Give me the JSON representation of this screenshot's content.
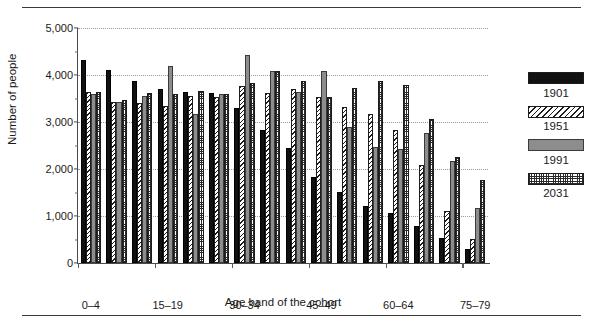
{
  "figure": {
    "clipped_title": "",
    "background": "#ffffff"
  },
  "axes": {
    "ylabel": "Number of people",
    "xlabel": "Age band of the cohort",
    "yticks": [
      "0",
      "1,000",
      "2,000",
      "3,000",
      "4,000",
      "5,000"
    ],
    "ymin": 0,
    "ymax": 5000
  },
  "legend": {
    "items": [
      {
        "label": "1901",
        "pattern": "solid-black",
        "color": "#111111"
      },
      {
        "label": "1951",
        "pattern": "diagonal-hatch",
        "color": "#ffffff"
      },
      {
        "label": "1991",
        "pattern": "solid-gray",
        "color": "#8d8d8d"
      },
      {
        "label": "2031",
        "pattern": "checker-dot",
        "color": "#ffffff"
      }
    ]
  },
  "chart_data": {
    "type": "bar",
    "title": "",
    "xlabel": "Age band of the cohort",
    "ylabel": "Number of people",
    "ylim": [
      0,
      5000
    ],
    "ytick_step": 1000,
    "grid": "horizontal-dotted",
    "legend_position": "right",
    "categories": [
      "0–4",
      "5–9",
      "10–14",
      "15–19",
      "20–24",
      "25–29",
      "30–34",
      "35–39",
      "40–44",
      "45–49",
      "50–54",
      "55–59",
      "60–64",
      "65–69",
      "70–74",
      "75–79"
    ],
    "visible_tick_labels": [
      "0–4",
      "15–19",
      "30–34",
      "45–49",
      "60–64",
      "75–79"
    ],
    "visible_tick_indices": [
      0,
      3,
      6,
      9,
      12,
      15
    ],
    "series": [
      {
        "name": "1901",
        "color": "#111111",
        "values": [
          4320,
          4100,
          3880,
          3700,
          3640,
          3620,
          3300,
          2840,
          2450,
          1820,
          1520,
          1220,
          1060,
          780,
          530,
          300
        ]
      },
      {
        "name": "1951",
        "color": "#ffffff",
        "values": [
          3640,
          3420,
          3400,
          3350,
          3560,
          3540,
          3770,
          3620,
          3700,
          3540,
          3320,
          3180,
          2830,
          2080,
          1100,
          520
        ]
      },
      {
        "name": "1991",
        "color": "#8d8d8d",
        "values": [
          3600,
          3430,
          3560,
          4190,
          3180,
          3600,
          4420,
          4080,
          3630,
          4080,
          2900,
          2470,
          2420,
          2760,
          2180,
          1180
        ]
      },
      {
        "name": "2031",
        "color": "#ffffff",
        "values": [
          3630,
          3460,
          3620,
          3600,
          3660,
          3590,
          3830,
          4090,
          3870,
          3540,
          3720,
          3880,
          3790,
          3060,
          2260,
          1770
        ]
      }
    ]
  }
}
